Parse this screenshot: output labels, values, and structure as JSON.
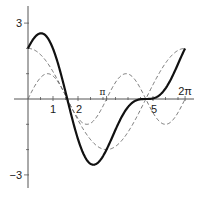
{
  "chart_data": {
    "type": "line",
    "title": "",
    "xlabel": "",
    "ylabel": "",
    "xlim": [
      0,
      6.7
    ],
    "ylim": [
      -3.2,
      3.4
    ],
    "grid": false,
    "legend": null,
    "x_ticks": [
      {
        "value": 1,
        "label": "1"
      },
      {
        "value": 2,
        "label": "2"
      },
      {
        "value": 3.14159,
        "label": "π"
      },
      {
        "value": 5,
        "label": "5"
      },
      {
        "value": 6.28318,
        "label": "2π"
      }
    ],
    "x_minor_ticks": [
      0.5,
      1.5,
      2.5,
      3,
      3.5,
      4,
      4.5,
      5.5,
      6
    ],
    "y_ticks": [
      {
        "value": 3,
        "label": "3"
      },
      {
        "value": -3,
        "label": "−3"
      }
    ],
    "y_minor_ticks": [
      1,
      2,
      -1,
      -2
    ],
    "series": [
      {
        "name": "2cos(x) + sin(2x)",
        "style": "solid-bold",
        "x": [
          0,
          0.25,
          0.5,
          0.52,
          0.75,
          1,
          1.25,
          1.5,
          1.57,
          1.75,
          2,
          2.25,
          2.5,
          2.62,
          2.75,
          3,
          3.25,
          3.5,
          3.75,
          4,
          4.25,
          4.5,
          4.71,
          5,
          5.25,
          5.5,
          5.75,
          6,
          6.28
        ],
        "values": [
          2.0,
          2.42,
          2.6,
          2.6,
          2.46,
          1.99,
          1.23,
          0.28,
          0.0,
          -0.71,
          -1.59,
          -2.23,
          -2.56,
          -2.6,
          -2.55,
          -2.26,
          -1.83,
          -1.4,
          -1.07,
          -0.92,
          -0.92,
          -0.99,
          -1.0,
          0.02,
          0.38,
          0.41,
          0.2,
          -0.05,
          2.0
        ]
      },
      {
        "name": "2cos(x)",
        "style": "dashed",
        "x": [
          0,
          0.5,
          1,
          1.5,
          1.57,
          2,
          2.5,
          3,
          3.14,
          3.5,
          4,
          4.5,
          4.71,
          5,
          5.5,
          6,
          6.28
        ],
        "values": [
          2.0,
          1.76,
          1.08,
          0.14,
          0.0,
          -0.83,
          -1.6,
          -1.98,
          -2.0,
          -1.87,
          -1.31,
          -0.42,
          0.0,
          0.57,
          1.42,
          1.92,
          2.0
        ]
      },
      {
        "name": "sin(2x)",
        "style": "dashed",
        "x": [
          0,
          0.39,
          0.785,
          1.18,
          1.57,
          1.96,
          2.36,
          2.75,
          3.14,
          3.53,
          3.93,
          4.32,
          4.71,
          5.11,
          5.5,
          5.89,
          6.28
        ],
        "values": [
          0,
          0.71,
          1.0,
          0.71,
          0,
          -0.71,
          -1.0,
          -0.71,
          0,
          0.71,
          1.0,
          0.71,
          0,
          -0.71,
          -1.0,
          -0.71,
          0
        ]
      }
    ],
    "functions": {
      "bold": "2*cos(x) + sin(2*x)",
      "dashed_1": "2*cos(x)",
      "dashed_2": "sin(2*x)",
      "domain": [
        0,
        6.28318
      ]
    }
  },
  "axes": {
    "origin_px": [
      28,
      99
    ],
    "unit_px": [
      25,
      25.3
    ],
    "x_axis_px": [
      14,
      194
    ],
    "y_axis_px": [
      6,
      188
    ]
  },
  "colors": {
    "axis": "#555555",
    "bold_line": "#111111",
    "dashed_line": "#666666",
    "text": "#1a1a1a"
  }
}
